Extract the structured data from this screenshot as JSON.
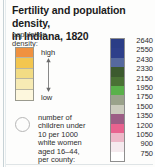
{
  "title": {
    "line1": "Fertility and population density,",
    "line2": "in Indiana, 1820"
  },
  "density_legend": {
    "heading_line1": "population",
    "heading_line2": "density:",
    "high_label": "high",
    "low_label": "low",
    "swatches": [
      {
        "color": "#f0913f",
        "label": "high"
      },
      {
        "color": "#f3c64f",
        "label": ""
      },
      {
        "color": "#f2dc84",
        "label": ""
      },
      {
        "color": "#f7ebb4",
        "label": ""
      },
      {
        "color": "#fdf7dd",
        "label": "low"
      }
    ]
  },
  "circle_legend": {
    "symbol": "circle-outline",
    "caption_lines": [
      "number of",
      "children under",
      "10 per 1000",
      "white women",
      "aged 16–44,",
      "per county:"
    ]
  },
  "chart_data": {
    "type": "heatmap",
    "title": "Fertility and population density, in Indiana, 1820",
    "xlabel": "",
    "ylabel": "",
    "legend_position": "right",
    "grid": false,
    "categories": [
      "2640",
      "2550",
      "2430",
      "2330",
      "2150",
      "1950",
      "1750",
      "1500",
      "1350",
      "1200",
      "1050",
      "900",
      "750"
    ],
    "values": [
      2640,
      2550,
      2430,
      2330,
      2150,
      1950,
      1750,
      1500,
      1350,
      1200,
      1050,
      900,
      750
    ],
    "colors": [
      "#2b3d86",
      "#2e3f8a",
      "#56699e",
      "#3c5a2e",
      "#4a7234",
      "#5ab14a",
      "#9aa28a",
      "#ccccbe",
      "#9c5d85",
      "#e8638f",
      "#edb8c8",
      "#f5eaee",
      "#ffffff"
    ],
    "series": [
      {
        "name": "children under 10 per 1000 white women aged 16-44, per county",
        "values": [
          2640,
          2550,
          2430,
          2330,
          2150,
          1950,
          1750,
          1500,
          1350,
          1200,
          1050,
          900,
          750
        ]
      }
    ],
    "ylim": [
      750,
      2640
    ]
  }
}
